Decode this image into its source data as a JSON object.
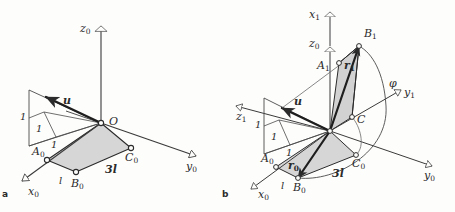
{
  "figure": {
    "background_color": "#fdfdfc",
    "stroke_color": "#2b2b2b",
    "shade_color": "#d6d6d6",
    "shade_color_dark": "#c2c2c2"
  },
  "panels": [
    {
      "id": "a",
      "label": "a"
    },
    {
      "id": "b",
      "label": "b"
    }
  ],
  "panel_a": {
    "axes": [
      {
        "name": "z0",
        "base": "z",
        "sub": "0"
      },
      {
        "name": "y0",
        "base": "y",
        "sub": "0"
      },
      {
        "name": "x0",
        "base": "x",
        "sub": "0"
      }
    ],
    "points": [
      {
        "name": "O",
        "base": "O",
        "sub": ""
      },
      {
        "name": "A0",
        "base": "A",
        "sub": "0"
      },
      {
        "name": "B0",
        "base": "B",
        "sub": "0"
      },
      {
        "name": "C0",
        "base": "C",
        "sub": "0"
      }
    ],
    "vectors": [
      {
        "name": "u",
        "base": "u",
        "sub": ""
      }
    ],
    "dimensions": [
      {
        "name": "side-short",
        "text": "l"
      },
      {
        "name": "side-long",
        "text": "3l"
      },
      {
        "name": "unit-x",
        "text": "1"
      },
      {
        "name": "unit-y",
        "text": "1"
      },
      {
        "name": "unit-z",
        "text": "1"
      }
    ]
  },
  "panel_b": {
    "axes": [
      {
        "name": "x1",
        "base": "x",
        "sub": "1"
      },
      {
        "name": "z0",
        "base": "z",
        "sub": "0"
      },
      {
        "name": "y1",
        "base": "y",
        "sub": "1"
      },
      {
        "name": "z1",
        "base": "z",
        "sub": "1"
      },
      {
        "name": "y0",
        "base": "y",
        "sub": "0"
      },
      {
        "name": "x0",
        "base": "x",
        "sub": "0"
      }
    ],
    "points": [
      {
        "name": "A1",
        "base": "A",
        "sub": "1"
      },
      {
        "name": "B1",
        "base": "B",
        "sub": "1"
      },
      {
        "name": "C",
        "base": "C",
        "sub": ""
      },
      {
        "name": "A0",
        "base": "A",
        "sub": "0"
      },
      {
        "name": "B0",
        "base": "B",
        "sub": "0"
      },
      {
        "name": "C0",
        "base": "C",
        "sub": "0"
      }
    ],
    "vectors": [
      {
        "name": "u",
        "base": "u",
        "sub": ""
      },
      {
        "name": "r0",
        "base": "r",
        "sub": "0"
      },
      {
        "name": "r1",
        "base": "r",
        "sub": "1"
      }
    ],
    "angles": [
      {
        "name": "phi",
        "text": "φ"
      }
    ],
    "dimensions": [
      {
        "name": "side-short",
        "text": "l"
      },
      {
        "name": "side-long",
        "text": "3l"
      },
      {
        "name": "unit-x",
        "text": "1"
      },
      {
        "name": "unit-y",
        "text": "1"
      },
      {
        "name": "unit-z",
        "text": "1"
      }
    ]
  }
}
